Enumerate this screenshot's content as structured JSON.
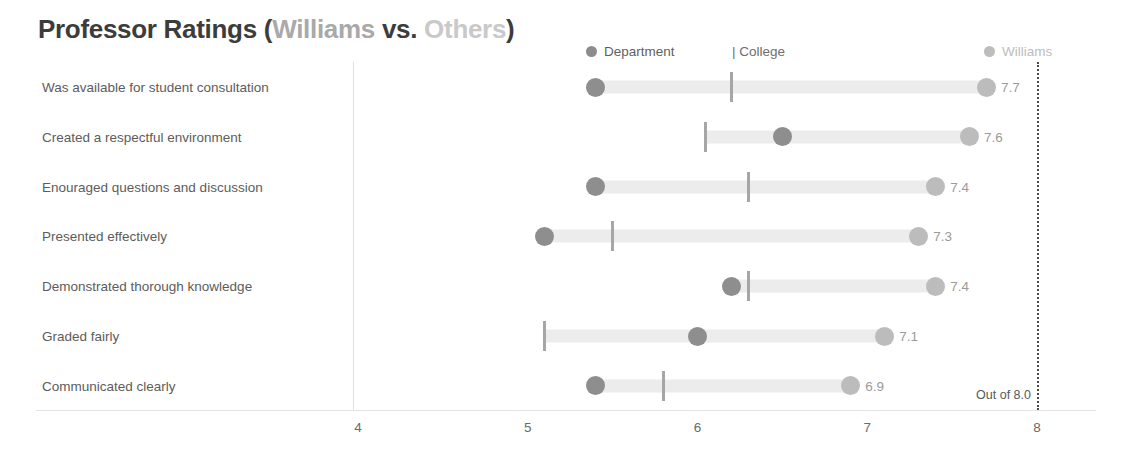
{
  "title": {
    "main": "Professor Ratings ",
    "paren_open": "(",
    "williams": "Williams",
    "vs": " vs. ",
    "others": "Others",
    "paren_close": ")"
  },
  "legend": {
    "department": "Department",
    "college": "| College",
    "williams": "Williams"
  },
  "annotation": {
    "out_of": "Out of 8.0"
  },
  "colors": {
    "department": "#8e8e8e",
    "college": "#a6a6a6",
    "williams": "#bcbcbc",
    "track": "#ececec",
    "target_line": "#4a4a4a",
    "title_dark": "#3c3c3c",
    "title_williams": "#a9a9a9",
    "title_others": "#c9c9c9"
  },
  "chart_data": {
    "type": "bar",
    "title": "Professor Ratings (Williams vs. Others)",
    "subtitle": "",
    "xlabel": "",
    "ylabel": "",
    "xlim": [
      3.7,
      8.15
    ],
    "xticks": [
      4,
      5,
      6,
      7,
      8
    ],
    "xtick_labels": [
      "4",
      "5",
      "6",
      "7",
      "8"
    ],
    "grid": false,
    "legend_position": "top",
    "target_value": 8.0,
    "annotation": "Out of 8.0",
    "categories": [
      "Was available for student consultation",
      "Created a respectful environment",
      "Enouraged questions and discussion",
      "Presented effectively",
      "Demonstrated thorough knowledge",
      "Graded fairly",
      "Communicated clearly"
    ],
    "series": [
      {
        "name": "Department",
        "marker": "dot",
        "values": [
          5.4,
          6.5,
          5.4,
          5.1,
          6.2,
          6.0,
          5.4
        ]
      },
      {
        "name": "College",
        "marker": "tick",
        "values": [
          6.2,
          6.05,
          6.3,
          5.5,
          6.3,
          5.1,
          5.8
        ]
      },
      {
        "name": "Williams",
        "marker": "dot",
        "values": [
          7.7,
          7.6,
          7.4,
          7.3,
          7.4,
          7.1,
          6.9
        ]
      }
    ],
    "value_labels": [
      "7.7",
      "7.6",
      "7.4",
      "7.3",
      "7.4",
      "7.1",
      "6.9"
    ]
  }
}
